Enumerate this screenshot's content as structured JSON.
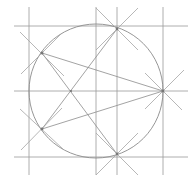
{
  "diagram": {
    "colors": {
      "lines": "#9a9a9a",
      "circle": "#8a8a8a",
      "points": "#777777",
      "background": "#ffffff"
    },
    "circle": {
      "cx": 96,
      "cy": 91,
      "r": 67
    },
    "horizontal_guides": [
      26,
      91,
      157
    ],
    "vertical_guides": [
      29,
      96,
      117,
      163
    ],
    "vertices": [
      {
        "name": "right",
        "x": 163,
        "y": 91
      },
      {
        "name": "top",
        "x": 117,
        "y": 29
      },
      {
        "name": "upper-left",
        "x": 42,
        "y": 53
      },
      {
        "name": "lower-left",
        "x": 42,
        "y": 129
      },
      {
        "name": "bottom",
        "x": 117,
        "y": 154
      }
    ],
    "center_mark": {
      "x": 71,
      "y": 91
    },
    "caption": ""
  }
}
